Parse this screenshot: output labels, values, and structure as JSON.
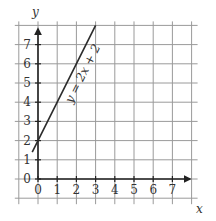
{
  "chart_data": {
    "type": "line",
    "title": "",
    "xlabel": "x",
    "ylabel": "y",
    "xlim": [
      -1,
      8
    ],
    "ylim": [
      -1,
      8
    ],
    "x_ticks": [
      "0",
      "1",
      "2",
      "3",
      "4",
      "5",
      "6",
      "7"
    ],
    "y_ticks": [
      "0",
      "1",
      "2",
      "3",
      "4",
      "5",
      "6",
      "7"
    ],
    "grid": true,
    "series": [
      {
        "name": "y = 2x + 2",
        "equation": "y = 2x + 2",
        "x": [
          -0.3,
          3
        ],
        "y": [
          1.4,
          8
        ]
      }
    ],
    "annotations": [
      {
        "text": "y = 2x + 2",
        "position": "along line, near x=2, y=5.5",
        "rotation": "parallel to line"
      }
    ],
    "colors": {
      "axis": "#222222",
      "grid": "#9a9a9a",
      "line": "#2a2a2a",
      "text": "#333333"
    }
  }
}
